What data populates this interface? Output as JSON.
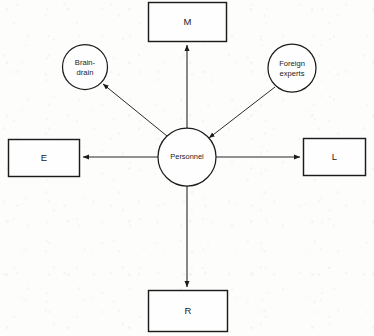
{
  "diagram": {
    "type": "radial-node-link",
    "background_color": "#fdfdfc",
    "stroke_color": "#1c1c1c",
    "nodes": [
      {
        "id": "personnel",
        "label": "Personnel",
        "shape": "circle",
        "role": "center"
      },
      {
        "id": "m",
        "label": "M",
        "shape": "rectangle",
        "role": "outcome"
      },
      {
        "id": "e",
        "label": "E",
        "shape": "rectangle",
        "role": "outcome"
      },
      {
        "id": "l",
        "label": "L",
        "shape": "rectangle",
        "role": "outcome"
      },
      {
        "id": "r",
        "label": "R",
        "shape": "rectangle",
        "role": "outcome"
      },
      {
        "id": "brain-drain",
        "label_line1": "Brain-",
        "label_line2": "drain",
        "label": "Brain-drain",
        "shape": "circle",
        "role": "flow"
      },
      {
        "id": "foreign-experts",
        "label_line1": "Foreign",
        "label_line2": "experts",
        "label": "Foreign experts",
        "shape": "circle",
        "role": "flow"
      }
    ],
    "edges": [
      {
        "from": "personnel",
        "to": "m",
        "arrowhead": "target",
        "direction": "up"
      },
      {
        "from": "personnel",
        "to": "e",
        "arrowhead": "target",
        "direction": "left"
      },
      {
        "from": "personnel",
        "to": "l",
        "arrowhead": "target",
        "direction": "right"
      },
      {
        "from": "personnel",
        "to": "r",
        "arrowhead": "target",
        "direction": "down"
      },
      {
        "from": "personnel",
        "to": "brain-drain",
        "arrowhead": "target",
        "direction": "up-left"
      },
      {
        "from": "foreign-experts",
        "to": "personnel",
        "arrowhead": "target",
        "direction": "down-left"
      }
    ]
  }
}
